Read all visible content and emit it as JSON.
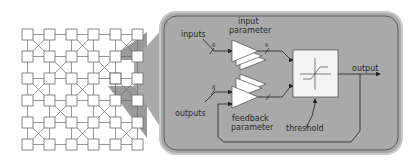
{
  "grid": {
    "rows": 6,
    "cols": 6,
    "highlight": {
      "row": 2,
      "col": 4
    },
    "colors": {
      "square_fill": "#ffffff",
      "line": "#6a6a6a",
      "highlight": "#8c8c8c"
    }
  },
  "panel": {
    "fill": "#a9a9a9",
    "border": "#4a4a4a",
    "labels": {
      "inputs": "inputs",
      "input_parameter_line1": "input",
      "input_parameter_line2": "parameter",
      "outputs": "outputs",
      "feedback_parameter_line1": "feedback",
      "feedback_parameter_line2": "parameter",
      "threshold": "threshold",
      "output": "output"
    },
    "bus_widths": {
      "inputs": "8",
      "input_param_out": "8",
      "outputs": "8",
      "feedback_param_out": "8"
    }
  }
}
